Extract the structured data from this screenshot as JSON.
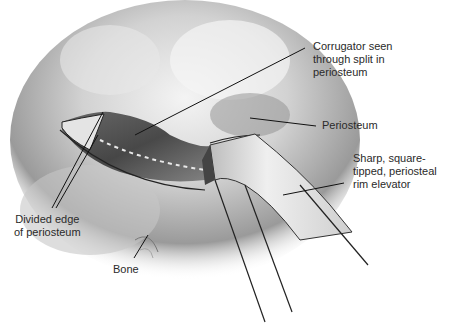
{
  "figure": {
    "labels": [
      {
        "id": "corrugator",
        "text": "Corrugator seen\nthrough split in\nperiosteum"
      },
      {
        "id": "periosteum",
        "text": "Periosteum"
      },
      {
        "id": "elevator",
        "text": "Sharp, square-\ntipped, periosteal\nrim elevator"
      },
      {
        "id": "divided_edge",
        "text": "Divided edge\nof periosteum"
      },
      {
        "id": "bone",
        "text": "Bone"
      }
    ]
  }
}
